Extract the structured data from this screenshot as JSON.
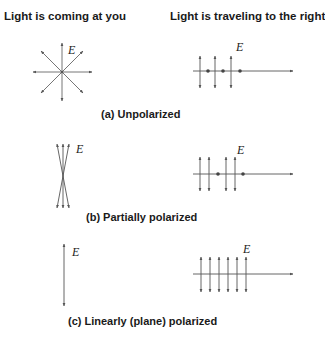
{
  "headings": {
    "left": "Light is coming at you",
    "right": "Light is traveling to the right"
  },
  "panels": [
    {
      "id": "a",
      "caption": "(a) Unpolarized",
      "field_label": "E"
    },
    {
      "id": "b",
      "caption": "(b) Partially polarized",
      "field_label": "E"
    },
    {
      "id": "c",
      "caption": "(c) Linearly (plane) polarized",
      "field_label": "E"
    }
  ],
  "colors": {
    "line": "#555555",
    "text": "#1a1a1a"
  }
}
